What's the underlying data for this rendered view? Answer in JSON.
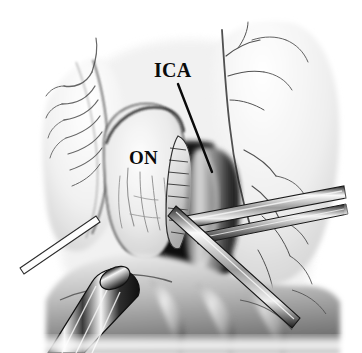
{
  "figure": {
    "kind": "surgical-anatomical-illustration",
    "view": "endoscopic endonasal view of the optic nerve and internal carotid artery",
    "style": "grayscale pen-and-wash medical illustration",
    "background_color": "#ffffff",
    "ink_color": "#0a0a0a",
    "width": 362,
    "height": 353
  },
  "labels": [
    {
      "id": "ica",
      "text": "ICA",
      "meaning": "internal carotid artery",
      "x": 154,
      "y": 60,
      "font_size": 20,
      "has_leader_line": true,
      "leader_line": {
        "x1": 178,
        "y1": 84,
        "x2": 212,
        "y2": 172
      }
    },
    {
      "id": "on",
      "text": "ON",
      "meaning": "optic nerve",
      "x": 129,
      "y": 148,
      "font_size": 19,
      "has_leader_line": false
    }
  ],
  "structures": [
    {
      "name": "optic-nerve",
      "label": "ON",
      "tone": "light-gray",
      "region": "center-left"
    },
    {
      "name": "internal-carotid-artery",
      "label": "ICA",
      "tone": "dark",
      "region": "center-right"
    },
    {
      "name": "cavernous-sinus-recess",
      "label": "",
      "tone": "dark",
      "region": "center"
    },
    {
      "name": "mucosal-flap-left",
      "label": "",
      "tone": "light",
      "region": "left"
    },
    {
      "name": "mucosal-flap-right",
      "label": "",
      "tone": "light",
      "region": "upper-right"
    },
    {
      "name": "vascular-branches-left",
      "label": "",
      "tone": "mid-gray",
      "region": "left"
    },
    {
      "name": "vascular-branches-right",
      "label": "",
      "tone": "mid-gray",
      "region": "right"
    },
    {
      "name": "sellar-floor-tissue",
      "label": "",
      "tone": "mid-gray",
      "region": "bottom"
    }
  ],
  "instruments": [
    {
      "name": "dissector-right",
      "description": "slender elongated dissector entering from the right margin",
      "region": "right"
    },
    {
      "name": "dissector-diagonal",
      "description": "diagonal shafted instrument crossing the center toward lower left",
      "region": "center"
    },
    {
      "name": "suction-tip-lower-left",
      "description": "suction cannula tip entering from the lower left",
      "region": "bottom-left"
    },
    {
      "name": "retractor-blade-left",
      "description": "thin straight retractor edge at mid-left",
      "region": "left"
    }
  ]
}
